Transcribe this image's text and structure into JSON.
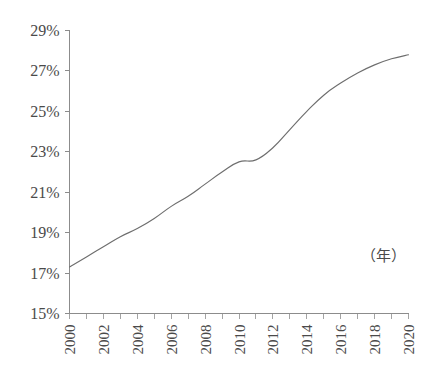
{
  "chart_data": {
    "type": "line",
    "title": "",
    "subtitle": "",
    "xlabel": "",
    "ylabel": "",
    "unit_note": "（年）",
    "grid": false,
    "legend": false,
    "legend_position": "none",
    "xlim": [
      2000,
      2020
    ],
    "ylim": [
      15,
      29
    ],
    "y_tick_labels": [
      "29%",
      "27%",
      "25%",
      "23%",
      "21%",
      "19%",
      "17%",
      "15%"
    ],
    "y_tick_values": [
      29,
      27,
      25,
      23,
      21,
      19,
      17,
      15
    ],
    "x_tick_labels": [
      "2000",
      "2002",
      "2004",
      "2006",
      "2008",
      "2010",
      "2012",
      "2014",
      "2016",
      "2018",
      "2020"
    ],
    "x_tick_values": [
      2000,
      2002,
      2004,
      2006,
      2008,
      2010,
      2012,
      2014,
      2016,
      2018,
      2020
    ],
    "x_minor_ticks": [
      2000,
      2001,
      2002,
      2003,
      2004,
      2005,
      2006,
      2007,
      2008,
      2009,
      2010,
      2011,
      2012,
      2013,
      2014,
      2015,
      2016,
      2017,
      2018,
      2019,
      2020
    ],
    "x": [
      2000,
      2001,
      2002,
      2003,
      2004,
      2005,
      2006,
      2007,
      2008,
      2009,
      2010,
      2011,
      2012,
      2013,
      2014,
      2015,
      2016,
      2017,
      2018,
      2019,
      2020
    ],
    "values": [
      17.3,
      17.8,
      18.3,
      18.8,
      19.2,
      19.7,
      20.3,
      20.8,
      21.4,
      22.0,
      22.5,
      22.6,
      23.2,
      24.1,
      25.0,
      25.8,
      26.4,
      26.9,
      27.3,
      27.6,
      27.8
    ],
    "series": [
      {
        "name": "",
        "color": "#6e6e6e",
        "values": [
          17.3,
          17.8,
          18.3,
          18.8,
          19.2,
          19.7,
          20.3,
          20.8,
          21.4,
          22.0,
          22.5,
          22.6,
          23.2,
          24.1,
          25.0,
          25.8,
          26.4,
          26.9,
          27.3,
          27.6,
          27.8
        ]
      }
    ],
    "annotations": [
      {
        "text": "（年）",
        "x": 2018.5,
        "y": 17.6
      }
    ]
  },
  "colors": {
    "background": "#ffffff",
    "axis": "#8c8c8c",
    "line": "#6e6e6e",
    "text": "#4a4a4a"
  }
}
